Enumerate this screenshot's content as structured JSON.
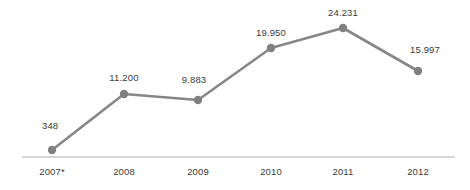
{
  "chart_data": {
    "type": "line",
    "title": "",
    "subtitle": "",
    "xlabel": "",
    "ylabel": "",
    "grid": false,
    "legend": null,
    "legend_position": "none",
    "categories": [
      "2007*",
      "2008",
      "2009",
      "2010",
      "2011",
      "2012"
    ],
    "x": [
      "2007*",
      "2008",
      "2009",
      "2010",
      "2011",
      "2012"
    ],
    "values": [
      348,
      11200,
      9883,
      19950,
      24231,
      15997
    ],
    "value_labels": [
      "348",
      "11.200",
      "9.883",
      "19.950",
      "24.231",
      "15.997"
    ],
    "tick_labels": [
      "2007*",
      "2008",
      "2009",
      "2010",
      "2011",
      "2012"
    ],
    "ylim": [
      0,
      26000
    ],
    "series": [
      {
        "name": "",
        "values": [
          348,
          11200,
          9883,
          19950,
          24231,
          15997
        ]
      }
    ],
    "annotations": [
      {
        "text": "*",
        "attached_to": "2007",
        "meaning": "footnote marker on 2007 category label"
      }
    ],
    "points": [
      {
        "category": "2007*",
        "value": 348,
        "label": "348",
        "px": 52,
        "py": 150,
        "label_x": 42,
        "label_y": 120,
        "label_align": "left"
      },
      {
        "category": "2008",
        "value": 11200,
        "label": "11.200",
        "px": 124,
        "py": 94,
        "label_x": 124,
        "label_y": 72,
        "label_align": "center"
      },
      {
        "category": "2009",
        "value": 9883,
        "label": "9.883",
        "px": 198,
        "py": 100,
        "label_x": 194,
        "label_y": 74,
        "label_align": "center"
      },
      {
        "category": "2010",
        "value": 19950,
        "label": "19.950",
        "px": 271,
        "py": 48,
        "label_x": 271,
        "label_y": 27,
        "label_align": "center"
      },
      {
        "category": "2011",
        "value": 24231,
        "label": "24.231",
        "px": 343,
        "py": 28,
        "label_x": 343,
        "label_y": 7,
        "label_align": "center"
      },
      {
        "category": "2012",
        "value": 15997,
        "label": "15.997",
        "px": 418,
        "py": 71,
        "label_x": 425,
        "label_y": 44,
        "label_align": "center"
      }
    ],
    "axis": {
      "x_axis_line_y": 157,
      "x_axis_line_start": 22,
      "x_axis_line_end": 455,
      "tick_label_y": 166
    },
    "colors": {
      "line": "#878787",
      "marker": "#808080",
      "text": "#3a3a3a",
      "axis_line": "#c8c8c8",
      "background": "#ffffff"
    },
    "style": {
      "line_width": 2.6,
      "marker_radius": 4.2
    }
  }
}
